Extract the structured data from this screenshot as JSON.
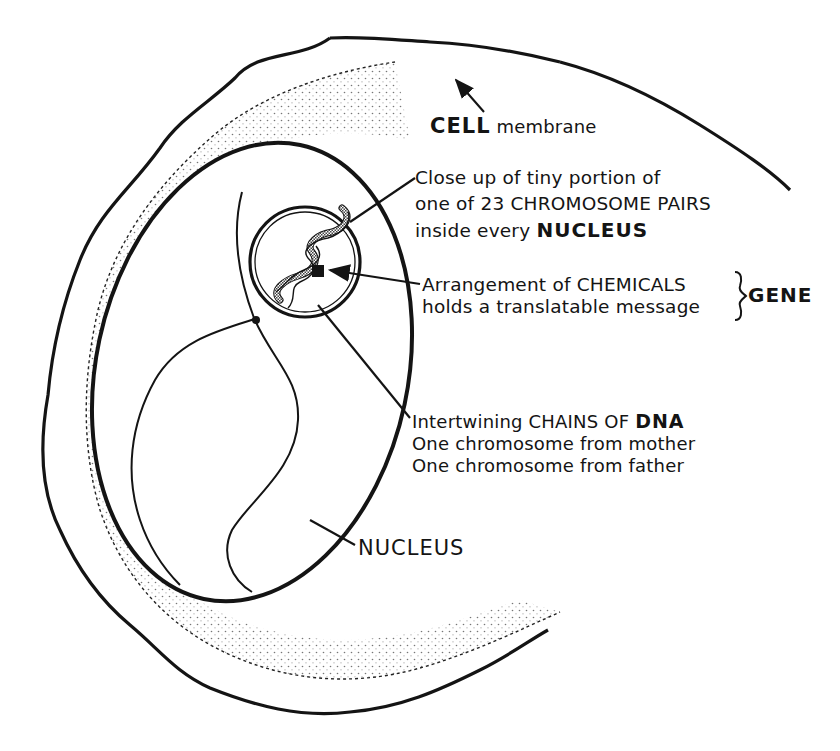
{
  "diagram": {
    "labels": {
      "cell_membrane": {
        "bold": "CELL",
        "rest": "membrane"
      },
      "closeup": {
        "line1": "Close up of tiny portion of",
        "line2": "one of 23 CHROMOSOME PAIRS",
        "line3_prefix": "inside every",
        "line3_bold": "NUCLEUS"
      },
      "gene": {
        "line1": "Arrangement of CHEMICALS",
        "line2": "holds a translatable message",
        "bracket_label": "GENE"
      },
      "dna": {
        "line1_prefix": "Intertwining CHAINS OF",
        "line1_bold": "DNA",
        "line2": "One chromosome from mother",
        "line3": "One chromosome from father"
      },
      "nucleus": "NUCLEUS"
    },
    "colors": {
      "ink": "#141414",
      "background": "#ffffff",
      "stipple": "#555555"
    }
  }
}
